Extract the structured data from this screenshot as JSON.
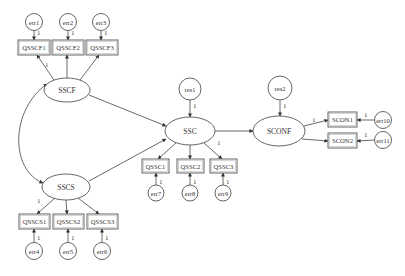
{
  "colors": {
    "stroke": "#555555",
    "background": "#ffffff",
    "text": "#333333"
  },
  "latent": [
    {
      "id": "SSCF",
      "label": "SSCF",
      "cx": 67,
      "cy": 90,
      "rx": 23,
      "ry": 12
    },
    {
      "id": "SSCS",
      "label": "SSCS",
      "cx": 66,
      "cy": 187,
      "rx": 24,
      "ry": 13
    },
    {
      "id": "SSC",
      "label": "SSC",
      "cx": 190,
      "cy": 131,
      "rx": 25,
      "ry": 14
    },
    {
      "id": "SCONF",
      "label": "SCONF",
      "cx": 279,
      "cy": 131,
      "rx": 26,
      "ry": 15
    }
  ],
  "observed": [
    {
      "id": "QSSCF1",
      "label": "QSSCF1",
      "x": 18,
      "y": 40,
      "w": 32,
      "h": 15
    },
    {
      "id": "QSSCF2",
      "label": "QSSCF2",
      "x": 52,
      "y": 40,
      "w": 32,
      "h": 15
    },
    {
      "id": "QSSCF3",
      "label": "QSSCF3",
      "x": 86,
      "y": 40,
      "w": 32,
      "h": 15
    },
    {
      "id": "QSSCS1",
      "label": "QSSCS1",
      "x": 19,
      "y": 214,
      "w": 31,
      "h": 15
    },
    {
      "id": "QSSCS2",
      "label": "QSSCS2",
      "x": 53,
      "y": 214,
      "w": 31,
      "h": 15
    },
    {
      "id": "QSSCS3",
      "label": "QSSCS3",
      "x": 87,
      "y": 214,
      "w": 31,
      "h": 15
    },
    {
      "id": "QSSC1",
      "label": "QSSC1",
      "x": 142,
      "y": 159,
      "w": 27,
      "h": 14
    },
    {
      "id": "QSSC2",
      "label": "QSSC2",
      "x": 177,
      "y": 159,
      "w": 27,
      "h": 14
    },
    {
      "id": "QSSC3",
      "label": "QSSC3",
      "x": 210,
      "y": 159,
      "w": 27,
      "h": 14
    },
    {
      "id": "SCON1",
      "label": "SCON1",
      "x": 328,
      "y": 112,
      "w": 29,
      "h": 15
    },
    {
      "id": "SCON2",
      "label": "SCON2",
      "x": 328,
      "y": 133,
      "w": 29,
      "h": 15
    }
  ],
  "errors": [
    {
      "id": "err1",
      "label": "err1",
      "cx": 34,
      "cy": 22,
      "r": 8.5
    },
    {
      "id": "err2",
      "label": "err2",
      "cx": 68,
      "cy": 22,
      "r": 8.5
    },
    {
      "id": "err3",
      "label": "err3",
      "cx": 101,
      "cy": 22,
      "r": 8.5
    },
    {
      "id": "err4",
      "label": "err4",
      "cx": 34,
      "cy": 251,
      "r": 8.5
    },
    {
      "id": "err5",
      "label": "err5",
      "cx": 68,
      "cy": 251,
      "r": 8.5
    },
    {
      "id": "err6",
      "label": "err6",
      "cx": 102,
      "cy": 251,
      "r": 8.5
    },
    {
      "id": "err7",
      "label": "err7",
      "cx": 156,
      "cy": 193,
      "r": 8
    },
    {
      "id": "err8",
      "label": "err8",
      "cx": 190,
      "cy": 193,
      "r": 8
    },
    {
      "id": "err9",
      "label": "err9",
      "cx": 223,
      "cy": 193,
      "r": 8
    },
    {
      "id": "err10",
      "label": "err10",
      "cx": 383,
      "cy": 120,
      "r": 8.5
    },
    {
      "id": "err11",
      "label": "err11",
      "cx": 383,
      "cy": 140,
      "r": 8.5
    },
    {
      "id": "res1",
      "label": "res1",
      "cx": 190,
      "cy": 89,
      "r": 11
    },
    {
      "id": "res2",
      "label": "res2",
      "cx": 280,
      "cy": 88,
      "r": 12
    }
  ],
  "edges": [
    {
      "x1": 34,
      "y1": 30.5,
      "x2": 34,
      "y2": 40
    },
    {
      "x1": 68,
      "y1": 30.5,
      "x2": 68,
      "y2": 40
    },
    {
      "x1": 101,
      "y1": 30.5,
      "x2": 101,
      "y2": 40
    },
    {
      "x1": 54,
      "y1": 80,
      "x2": 37,
      "y2": 55
    },
    {
      "x1": 67,
      "y1": 78,
      "x2": 67,
      "y2": 55
    },
    {
      "x1": 80,
      "y1": 80,
      "x2": 99,
      "y2": 55
    },
    {
      "x1": 55,
      "y1": 198,
      "x2": 37,
      "y2": 214
    },
    {
      "x1": 66,
      "y1": 200,
      "x2": 67,
      "y2": 214
    },
    {
      "x1": 78,
      "y1": 198,
      "x2": 99,
      "y2": 214
    },
    {
      "x1": 34,
      "y1": 242.5,
      "x2": 34,
      "y2": 229
    },
    {
      "x1": 68,
      "y1": 242.5,
      "x2": 68,
      "y2": 229
    },
    {
      "x1": 102,
      "y1": 242.5,
      "x2": 102,
      "y2": 229
    },
    {
      "x1": 89,
      "y1": 95,
      "x2": 166,
      "y2": 126
    },
    {
      "x1": 89,
      "y1": 181,
      "x2": 166,
      "y2": 139
    },
    {
      "x1": 190,
      "y1": 100,
      "x2": 190,
      "y2": 117
    },
    {
      "x1": 176,
      "y1": 143,
      "x2": 158,
      "y2": 159
    },
    {
      "x1": 190,
      "y1": 145,
      "x2": 190,
      "y2": 159
    },
    {
      "x1": 204,
      "y1": 143,
      "x2": 222,
      "y2": 159
    },
    {
      "x1": 156,
      "y1": 185,
      "x2": 156,
      "y2": 173
    },
    {
      "x1": 190,
      "y1": 185,
      "x2": 190,
      "y2": 173
    },
    {
      "x1": 223,
      "y1": 185,
      "x2": 223,
      "y2": 173
    },
    {
      "x1": 215,
      "y1": 131,
      "x2": 253,
      "y2": 131
    },
    {
      "x1": 280,
      "y1": 100,
      "x2": 280,
      "y2": 116
    },
    {
      "x1": 304,
      "y1": 126,
      "x2": 328,
      "y2": 120
    },
    {
      "x1": 302,
      "y1": 139,
      "x2": 328,
      "y2": 141
    },
    {
      "x1": 374.5,
      "y1": 120,
      "x2": 357,
      "y2": 120
    },
    {
      "x1": 374.5,
      "y1": 140,
      "x2": 357,
      "y2": 141
    }
  ],
  "covariance": {
    "path": "M 47 84 C 10 110, 10 170, 43 183"
  },
  "path_labels": [
    {
      "text": "1",
      "x": 37,
      "y": 35
    },
    {
      "text": "1",
      "x": 71,
      "y": 35
    },
    {
      "text": "1",
      "x": 104,
      "y": 35
    },
    {
      "text": "1",
      "x": 45,
      "y": 67
    },
    {
      "text": "1",
      "x": 37,
      "y": 203
    },
    {
      "text": "1",
      "x": 37,
      "y": 240
    },
    {
      "text": "1",
      "x": 71,
      "y": 240
    },
    {
      "text": "1",
      "x": 105,
      "y": 240
    },
    {
      "text": "1",
      "x": 193,
      "y": 108
    },
    {
      "text": "1",
      "x": 217,
      "y": 145
    },
    {
      "text": "1",
      "x": 159,
      "y": 184
    },
    {
      "text": "1",
      "x": 193,
      "y": 184
    },
    {
      "text": "1",
      "x": 226,
      "y": 184
    },
    {
      "text": "1",
      "x": 283,
      "y": 108
    },
    {
      "text": "1",
      "x": 312,
      "y": 122
    },
    {
      "text": "1",
      "x": 364,
      "y": 117
    },
    {
      "text": "1",
      "x": 364,
      "y": 137
    }
  ]
}
